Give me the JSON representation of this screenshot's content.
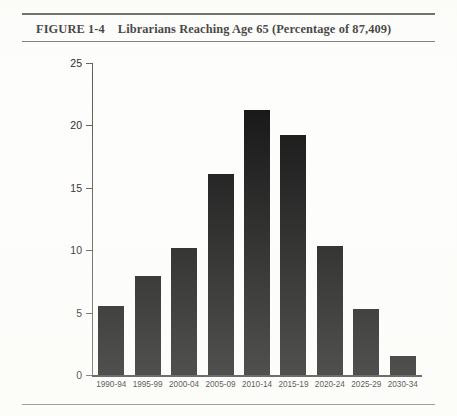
{
  "figure": {
    "number_label": "FIGURE 1-4",
    "caption": "Librarians Reaching Age 65 (Percentage of 87,409)"
  },
  "chart_data": {
    "type": "bar",
    "title": "Librarians Reaching Age 65 (Percentage of 87,409)",
    "categories": [
      "1990-94",
      "1995-99",
      "2000-04",
      "2005-09",
      "2010-14",
      "2015-19",
      "2020-24",
      "2025-29",
      "2030-34"
    ],
    "values": [
      5.5,
      7.9,
      10.2,
      16.1,
      21.2,
      19.2,
      10.3,
      5.3,
      1.5
    ],
    "xlabel": "",
    "ylabel": "",
    "ylim": [
      0,
      25
    ],
    "yticks": [
      0,
      5,
      10,
      15,
      20,
      25
    ],
    "ytick_labels": [
      "0",
      "5",
      "10",
      "15",
      "20",
      "25"
    ],
    "grid": false,
    "legend": null,
    "bar_color": "#121212",
    "axis_color": "#5d5d5a"
  }
}
